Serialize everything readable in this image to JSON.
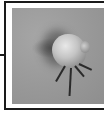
{
  "figure": {
    "photo": {
      "subject": "mite-specimen",
      "style": "grayscale-photograph"
    },
    "colors": {
      "frame": "#1a1a1a",
      "background": "#ffffff",
      "photo_base": "#9a9a9a"
    }
  }
}
